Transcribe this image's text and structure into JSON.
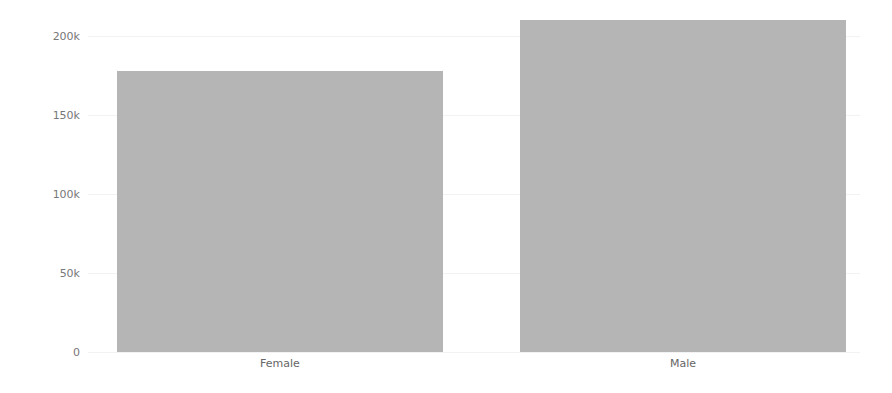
{
  "chart_data": {
    "type": "bar",
    "title": "",
    "xlabel": "",
    "ylabel": "",
    "categories": [
      "Female",
      "Male"
    ],
    "values": [
      178000,
      210000
    ],
    "ylim": [
      0,
      210000
    ],
    "yticks": [
      0,
      50000,
      100000,
      150000,
      200000
    ],
    "ytick_labels": [
      "0",
      "50k",
      "100k",
      "150k",
      "200k"
    ],
    "bar_color": "#b5b5b5",
    "grid": true,
    "legend": null
  }
}
